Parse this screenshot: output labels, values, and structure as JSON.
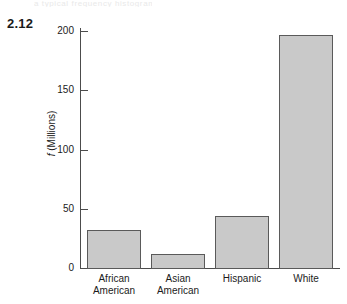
{
  "figure": {
    "number": "2.12",
    "scan_artifact_text": "a typical frequency histogram"
  },
  "chart_data": {
    "type": "bar",
    "title": "",
    "subtitle": "",
    "xlabel": "",
    "ylabel": "f (Millions)",
    "ylabel_italic_part": "f",
    "ylabel_rest": " (Millions)",
    "categories": [
      "African American",
      "Asian American",
      "Hispanic",
      "White"
    ],
    "category_lines": [
      [
        "African",
        "American"
      ],
      [
        "Asian",
        "American"
      ],
      [
        "Hispanic",
        ""
      ],
      [
        "White",
        ""
      ]
    ],
    "values": [
      32,
      12,
      44,
      197
    ],
    "ylim": [
      0,
      210
    ],
    "yticks": [
      0,
      50,
      100,
      150,
      200
    ],
    "ytick_labels": [
      "0",
      "50",
      "100",
      "150",
      "200"
    ],
    "grid": false,
    "legend": false,
    "legend_position": "none",
    "bar_fill_color": "#c9c9c9",
    "bar_border_color": "#5a5a5a",
    "axis_color": "#4c4c4c",
    "text_color": "#1b1b1b",
    "background_color": "#ffffff"
  }
}
